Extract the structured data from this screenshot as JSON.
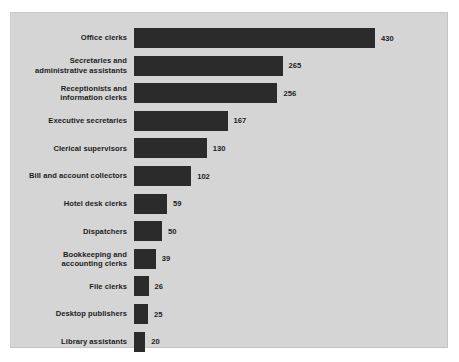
{
  "colors": {
    "page_background": "#ffffff",
    "card_background": "#d5d5d5",
    "bar_color": "#2b2b2b",
    "text_color": "#1d1d1d"
  },
  "chart_data": {
    "type": "bar",
    "orientation": "horizontal",
    "title": "",
    "subtitle": "",
    "xlabel": "",
    "ylabel": "",
    "grid": false,
    "legend": false,
    "xlim": [
      0,
      430
    ],
    "categories": [
      "Office clerks",
      "Secretaries and\nadministrative assistants",
      "Receptionists and\ninformation clerks",
      "Executive secretaries",
      "Clerical supervisors",
      "Bill and account collectors",
      "Hotel desk clerks",
      "Dispatchers",
      "Bookkeeping and\naccounting clerks",
      "File clerks",
      "Desktop publishers",
      "Library assistants"
    ],
    "values": [
      430,
      265,
      256,
      167,
      130,
      102,
      59,
      50,
      39,
      26,
      25,
      20
    ],
    "value_labels": [
      "430",
      "265",
      "256",
      "167",
      "130",
      "102",
      "59",
      "50",
      "39",
      "26",
      "25",
      "20"
    ]
  }
}
